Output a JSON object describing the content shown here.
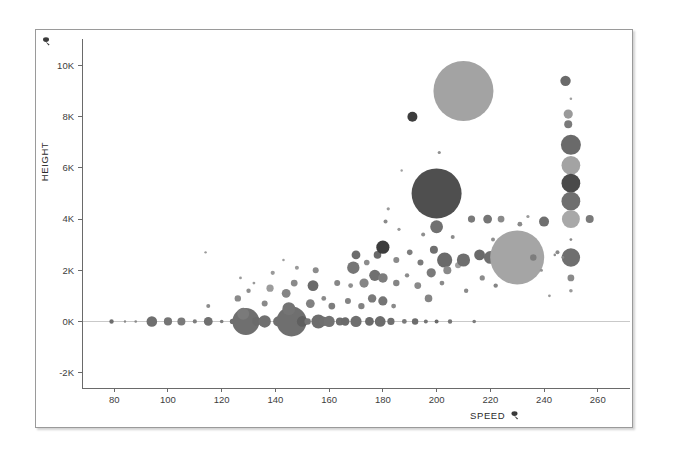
{
  "chart_data": {
    "type": "scatter",
    "title": "",
    "subtitle": "",
    "xlabel": "SPEED",
    "ylabel": "HEIGHT",
    "xlabel_icon": "sort-icon",
    "ylabel_icon": "sort-icon",
    "xlim": [
      68,
      272
    ],
    "ylim": [
      -2600,
      10800
    ],
    "xticks": [
      80,
      100,
      120,
      140,
      160,
      180,
      200,
      220,
      240,
      260
    ],
    "xtick_labels": [
      "80",
      "100",
      "120",
      "140",
      "160",
      "180",
      "200",
      "220",
      "240",
      "260"
    ],
    "yticks": [
      -2000,
      0,
      2000,
      4000,
      6000,
      8000,
      10000
    ],
    "ytick_labels": [
      "-2K",
      "0K",
      "2K",
      "4K",
      "6K",
      "8K",
      "10K"
    ],
    "grid": false,
    "legend": null,
    "size_encoding": "bubble area proportional to a third measure",
    "colors": {
      "bubble_dark": "#4f4f4f",
      "bubble_mid": "#808080",
      "bubble_light": "#a8a8a8",
      "axis": "#6a6a6a",
      "text": "#3d3d3d",
      "panel_border": "#9a9a9a",
      "background": "#ffffff"
    },
    "points": [
      {
        "x": 79,
        "y": 0,
        "r": 2.2,
        "c": "#6d6d6d"
      },
      {
        "x": 84,
        "y": 0,
        "r": 1.2,
        "c": "#8a8a8a"
      },
      {
        "x": 88,
        "y": 0,
        "r": 1.3,
        "c": "#8a8a8a"
      },
      {
        "x": 94,
        "y": 0,
        "r": 5.3,
        "c": "#6f6f6f"
      },
      {
        "x": 100,
        "y": 0,
        "r": 4.1,
        "c": "#757575"
      },
      {
        "x": 105,
        "y": 0,
        "r": 4.0,
        "c": "#7a7a7a"
      },
      {
        "x": 110,
        "y": 0,
        "r": 2.1,
        "c": "#7d7d7d"
      },
      {
        "x": 115,
        "y": 0,
        "r": 4.4,
        "c": "#707070"
      },
      {
        "x": 115,
        "y": 600,
        "r": 2.0,
        "c": "#8c8c8c"
      },
      {
        "x": 114,
        "y": 2700,
        "r": 1.2,
        "c": "#9a9a9a"
      },
      {
        "x": 120,
        "y": 0,
        "r": 1.8,
        "c": "#7d7d7d"
      },
      {
        "x": 124,
        "y": 0,
        "r": 2.6,
        "c": "#6f6f6f"
      },
      {
        "x": 126,
        "y": 0,
        "r": 3.0,
        "c": "#767676"
      },
      {
        "x": 129,
        "y": 0,
        "r": 13.5,
        "c": "#6f6f6f"
      },
      {
        "x": 128,
        "y": 300,
        "r": 6.0,
        "c": "#7a7a7a"
      },
      {
        "x": 126,
        "y": 900,
        "r": 3.2,
        "c": "#8a8a8a"
      },
      {
        "x": 130,
        "y": 1200,
        "r": 2.2,
        "c": "#8f8f8f"
      },
      {
        "x": 132,
        "y": 1500,
        "r": 1.4,
        "c": "#9a9a9a"
      },
      {
        "x": 127,
        "y": 1700,
        "r": 1.4,
        "c": "#9a9a9a"
      },
      {
        "x": 133,
        "y": 0,
        "r": 4.4,
        "c": "#6b6b6b"
      },
      {
        "x": 136,
        "y": 0,
        "r": 6.2,
        "c": "#707070"
      },
      {
        "x": 136,
        "y": 700,
        "r": 3.0,
        "c": "#8a8a8a"
      },
      {
        "x": 138,
        "y": 1300,
        "r": 3.6,
        "c": "#9c9c9c"
      },
      {
        "x": 139,
        "y": 1900,
        "r": 2.1,
        "c": "#9a9a9a"
      },
      {
        "x": 141,
        "y": 0,
        "r": 5.0,
        "c": "#6f6f6f"
      },
      {
        "x": 143,
        "y": 0,
        "r": 3.2,
        "c": "#7a7a7a"
      },
      {
        "x": 146,
        "y": 0,
        "r": 15.0,
        "c": "#6f6f6f"
      },
      {
        "x": 145,
        "y": 500,
        "r": 6.5,
        "c": "#747474"
      },
      {
        "x": 144,
        "y": 1100,
        "r": 4.4,
        "c": "#858585"
      },
      {
        "x": 147,
        "y": 1500,
        "r": 3.4,
        "c": "#8a8a8a"
      },
      {
        "x": 148,
        "y": 2100,
        "r": 2.0,
        "c": "#9a9a9a"
      },
      {
        "x": 143,
        "y": 2400,
        "r": 1.3,
        "c": "#a0a0a0"
      },
      {
        "x": 150,
        "y": 0,
        "r": 5.4,
        "c": "#5f5f5f"
      },
      {
        "x": 152,
        "y": 0,
        "r": 3.2,
        "c": "#757575"
      },
      {
        "x": 153,
        "y": 700,
        "r": 4.4,
        "c": "#818181"
      },
      {
        "x": 154,
        "y": 1400,
        "r": 5.4,
        "c": "#6a6a6a"
      },
      {
        "x": 155,
        "y": 2000,
        "r": 3.0,
        "c": "#8c8c8c"
      },
      {
        "x": 156,
        "y": 0,
        "r": 7.0,
        "c": "#6d6d6d"
      },
      {
        "x": 158,
        "y": 0,
        "r": 4.6,
        "c": "#6f6f6f"
      },
      {
        "x": 158,
        "y": 900,
        "r": 2.4,
        "c": "#8a8a8a"
      },
      {
        "x": 160,
        "y": 0,
        "r": 5.6,
        "c": "#727272"
      },
      {
        "x": 161,
        "y": 600,
        "r": 3.4,
        "c": "#7d7d7d"
      },
      {
        "x": 163,
        "y": 1500,
        "r": 3.0,
        "c": "#878787"
      },
      {
        "x": 164,
        "y": 0,
        "r": 4.0,
        "c": "#6d6d6d"
      },
      {
        "x": 166,
        "y": 0,
        "r": 4.2,
        "c": "#6a6a6a"
      },
      {
        "x": 167,
        "y": 800,
        "r": 3.0,
        "c": "#848484"
      },
      {
        "x": 168,
        "y": 1400,
        "r": 2.4,
        "c": "#8f8f8f"
      },
      {
        "x": 169,
        "y": 2100,
        "r": 6.2,
        "c": "#767676"
      },
      {
        "x": 170,
        "y": 2600,
        "r": 4.4,
        "c": "#6c6c6c"
      },
      {
        "x": 170,
        "y": 0,
        "r": 5.6,
        "c": "#6f6f6f"
      },
      {
        "x": 172,
        "y": 600,
        "r": 3.2,
        "c": "#828282"
      },
      {
        "x": 173,
        "y": 1500,
        "r": 4.6,
        "c": "#858585"
      },
      {
        "x": 174,
        "y": 2300,
        "r": 2.8,
        "c": "#8c8c8c"
      },
      {
        "x": 175,
        "y": 0,
        "r": 4.4,
        "c": "#6a6a6a"
      },
      {
        "x": 176,
        "y": 900,
        "r": 4.2,
        "c": "#7a7a7a"
      },
      {
        "x": 177,
        "y": 1800,
        "r": 5.6,
        "c": "#707070"
      },
      {
        "x": 178,
        "y": 2600,
        "r": 3.8,
        "c": "#6a6a6a"
      },
      {
        "x": 179,
        "y": 0,
        "r": 5.4,
        "c": "#6c6c6c"
      },
      {
        "x": 180,
        "y": 800,
        "r": 4.6,
        "c": "#757575"
      },
      {
        "x": 180,
        "y": 1700,
        "r": 4.8,
        "c": "#7d7d7d"
      },
      {
        "x": 180,
        "y": 2900,
        "r": 6.6,
        "c": "#3c3c3c"
      },
      {
        "x": 181,
        "y": 3900,
        "r": 2.0,
        "c": "#8a8a8a"
      },
      {
        "x": 182,
        "y": 4400,
        "r": 1.6,
        "c": "#9a9a9a"
      },
      {
        "x": 183,
        "y": 0,
        "r": 3.6,
        "c": "#6f6f6f"
      },
      {
        "x": 184,
        "y": 600,
        "r": 2.4,
        "c": "#8a8a8a"
      },
      {
        "x": 185,
        "y": 1500,
        "r": 3.2,
        "c": "#858585"
      },
      {
        "x": 185,
        "y": 2400,
        "r": 3.0,
        "c": "#8a8a8a"
      },
      {
        "x": 186,
        "y": 3600,
        "r": 1.6,
        "c": "#999999"
      },
      {
        "x": 187,
        "y": 5900,
        "r": 1.2,
        "c": "#a0a0a0"
      },
      {
        "x": 188,
        "y": 0,
        "r": 2.4,
        "c": "#7a7a7a"
      },
      {
        "x": 189,
        "y": 1800,
        "r": 2.2,
        "c": "#8c8c8c"
      },
      {
        "x": 190,
        "y": 2700,
        "r": 2.8,
        "c": "#7d7d7d"
      },
      {
        "x": 191,
        "y": 8000,
        "r": 5.0,
        "c": "#3d3d3d"
      },
      {
        "x": 192,
        "y": 0,
        "r": 3.2,
        "c": "#6d6d6d"
      },
      {
        "x": 193,
        "y": 1400,
        "r": 3.4,
        "c": "#8a8a8a"
      },
      {
        "x": 194,
        "y": 2300,
        "r": 3.0,
        "c": "#7a7a7a"
      },
      {
        "x": 195,
        "y": 3400,
        "r": 2.0,
        "c": "#8f8f8f"
      },
      {
        "x": 196,
        "y": 0,
        "r": 2.0,
        "c": "#747474"
      },
      {
        "x": 197,
        "y": 900,
        "r": 3.8,
        "c": "#858585"
      },
      {
        "x": 198,
        "y": 1900,
        "r": 4.6,
        "c": "#7a7a7a"
      },
      {
        "x": 199,
        "y": 2800,
        "r": 4.0,
        "c": "#6f6f6f"
      },
      {
        "x": 200,
        "y": 3700,
        "r": 6.4,
        "c": "#707070"
      },
      {
        "x": 200,
        "y": 5000,
        "r": 25.0,
        "c": "#4f4f4f"
      },
      {
        "x": 200,
        "y": 0,
        "r": 2.0,
        "c": "#6a6a6a"
      },
      {
        "x": 201,
        "y": 6600,
        "r": 1.6,
        "c": "#909090"
      },
      {
        "x": 202,
        "y": 1500,
        "r": 2.4,
        "c": "#8a8a8a"
      },
      {
        "x": 203,
        "y": 2400,
        "r": 7.6,
        "c": "#6a6a6a"
      },
      {
        "x": 204,
        "y": 2000,
        "r": 4.0,
        "c": "#8a8a8a"
      },
      {
        "x": 205,
        "y": 0,
        "r": 2.2,
        "c": "#767676"
      },
      {
        "x": 206,
        "y": 3300,
        "r": 2.0,
        "c": "#8c8c8c"
      },
      {
        "x": 208,
        "y": 2200,
        "r": 3.0,
        "c": "#a0a0a0"
      },
      {
        "x": 210,
        "y": 9000,
        "r": 30.0,
        "c": "#a3a3a3"
      },
      {
        "x": 210,
        "y": 2400,
        "r": 6.6,
        "c": "#6e6e6e"
      },
      {
        "x": 211,
        "y": 1200,
        "r": 2.2,
        "c": "#8a8a8a"
      },
      {
        "x": 213,
        "y": 4000,
        "r": 3.6,
        "c": "#7a7a7a"
      },
      {
        "x": 214,
        "y": 0,
        "r": 1.8,
        "c": "#7d7d7d"
      },
      {
        "x": 216,
        "y": 2600,
        "r": 5.4,
        "c": "#6a6a6a"
      },
      {
        "x": 217,
        "y": 1700,
        "r": 2.6,
        "c": "#8c8c8c"
      },
      {
        "x": 219,
        "y": 4000,
        "r": 4.4,
        "c": "#757575"
      },
      {
        "x": 220,
        "y": 2500,
        "r": 6.4,
        "c": "#6f6f6f"
      },
      {
        "x": 221,
        "y": 3200,
        "r": 2.0,
        "c": "#8f8f8f"
      },
      {
        "x": 222,
        "y": 1400,
        "r": 2.2,
        "c": "#858585"
      },
      {
        "x": 224,
        "y": 4000,
        "r": 3.4,
        "c": "#8a8a8a"
      },
      {
        "x": 225,
        "y": 2900,
        "r": 4.6,
        "c": "#757575"
      },
      {
        "x": 227,
        "y": 2500,
        "r": 3.0,
        "c": "#8c8c8c"
      },
      {
        "x": 230,
        "y": 2500,
        "r": 27.0,
        "c": "#a5a5a5"
      },
      {
        "x": 231,
        "y": 3800,
        "r": 2.4,
        "c": "#8a8a8a"
      },
      {
        "x": 234,
        "y": 4100,
        "r": 1.6,
        "c": "#9a9a9a"
      },
      {
        "x": 236,
        "y": 2500,
        "r": 3.2,
        "c": "#7d7d7d"
      },
      {
        "x": 239,
        "y": 2000,
        "r": 1.6,
        "c": "#949494"
      },
      {
        "x": 240,
        "y": 3900,
        "r": 5.0,
        "c": "#6f6f6f"
      },
      {
        "x": 242,
        "y": 1000,
        "r": 1.4,
        "c": "#9a9a9a"
      },
      {
        "x": 245,
        "y": 2700,
        "r": 2.0,
        "c": "#8a8a8a"
      },
      {
        "x": 248,
        "y": 9400,
        "r": 5.2,
        "c": "#6a6a6a"
      },
      {
        "x": 249,
        "y": 8100,
        "r": 4.6,
        "c": "#9a9a9a"
      },
      {
        "x": 249,
        "y": 7700,
        "r": 4.0,
        "c": "#7a7a7a"
      },
      {
        "x": 250,
        "y": 6900,
        "r": 10.0,
        "c": "#6a6a6a"
      },
      {
        "x": 250,
        "y": 6100,
        "r": 9.4,
        "c": "#a3a3a3"
      },
      {
        "x": 250,
        "y": 5400,
        "r": 9.4,
        "c": "#4a4a4a"
      },
      {
        "x": 250,
        "y": 4700,
        "r": 9.4,
        "c": "#6f6f6f"
      },
      {
        "x": 250,
        "y": 4000,
        "r": 9.0,
        "c": "#a8a8a8"
      },
      {
        "x": 250,
        "y": 3200,
        "r": 1.4,
        "c": "#8a8a8a"
      },
      {
        "x": 250,
        "y": 2500,
        "r": 9.2,
        "c": "#6f6f6f"
      },
      {
        "x": 250,
        "y": 1700,
        "r": 3.4,
        "c": "#8a8a8a"
      },
      {
        "x": 250,
        "y": 1200,
        "r": 1.8,
        "c": "#9a9a9a"
      },
      {
        "x": 250,
        "y": 8700,
        "r": 1.3,
        "c": "#a0a0a0"
      },
      {
        "x": 257,
        "y": 4000,
        "r": 4.0,
        "c": "#7a7a7a"
      },
      {
        "x": 247,
        "y": 2500,
        "r": 1.4,
        "c": "#888888"
      },
      {
        "x": 244,
        "y": 2600,
        "r": 1.3,
        "c": "#8f8f8f"
      }
    ]
  }
}
